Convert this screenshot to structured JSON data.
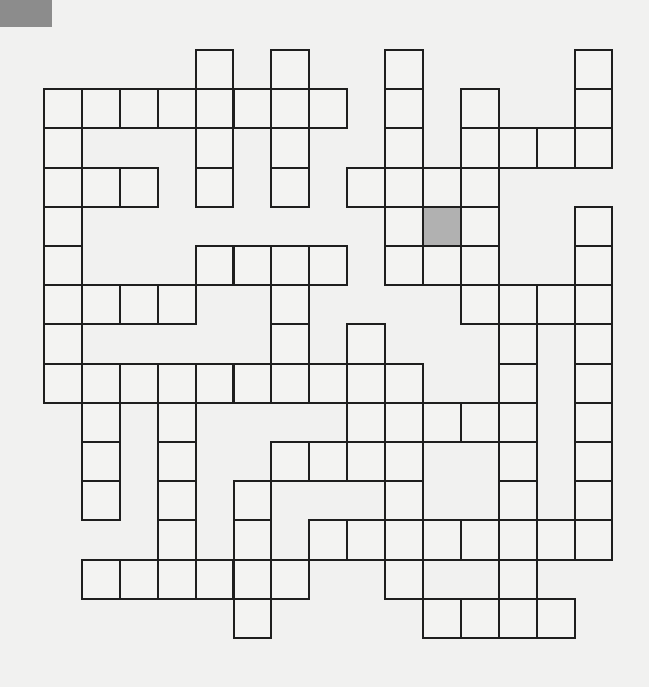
{
  "puzzle": {
    "type": "crossword",
    "rows": 15,
    "cols": 15,
    "cell_width": 37.9,
    "cell_height": 39.2,
    "colors": {
      "background": "#f1f1f0",
      "cell_fill": "#f3f3f2",
      "shaded_cell": "#b1b1b1",
      "grid_line": "#1e1e1e",
      "corner_block": "#8c8c8c"
    },
    "white_cells": [
      [
        4,
        6,
        9,
        14
      ],
      [
        0,
        1,
        2,
        3,
        4,
        5,
        6,
        7,
        9,
        11,
        14
      ],
      [
        0,
        4,
        6,
        9,
        11,
        12,
        13,
        14
      ],
      [
        0,
        1,
        2,
        4,
        6,
        8,
        9,
        10,
        11
      ],
      [
        0,
        9,
        10,
        11,
        14
      ],
      [
        0,
        4,
        5,
        6,
        7,
        9,
        10,
        11,
        14
      ],
      [
        0,
        1,
        2,
        3,
        6,
        11,
        12,
        13,
        14
      ],
      [
        0,
        6,
        8,
        12,
        14
      ],
      [
        0,
        1,
        2,
        3,
        4,
        5,
        6,
        7,
        8,
        9,
        12,
        14
      ],
      [
        1,
        3,
        8,
        9,
        10,
        11,
        12,
        14
      ],
      [
        1,
        3,
        6,
        7,
        8,
        9,
        12,
        14
      ],
      [
        1,
        3,
        5,
        9,
        12,
        14
      ],
      [
        3,
        5,
        7,
        8,
        9,
        10,
        11,
        12,
        13,
        14
      ],
      [
        1,
        2,
        3,
        4,
        5,
        6,
        9,
        12
      ],
      [
        5,
        10,
        11,
        12,
        13
      ]
    ],
    "shaded_cells": [
      [
        4,
        10
      ]
    ]
  }
}
